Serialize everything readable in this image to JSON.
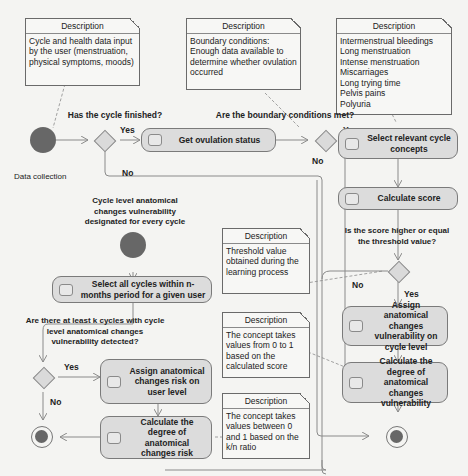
{
  "notes": {
    "data_input": {
      "header": "Description",
      "text": "Cycle and health data input by the user (menstruation, physical symptoms, moods)"
    },
    "boundary": {
      "header": "Description",
      "text": "Boundary conditions: Enough data available to determine whether ovulation occurred"
    },
    "concepts": {
      "header": "Description",
      "items": [
        "Intermenstrual bleedings",
        "Long menstruation",
        "Intense menstruation",
        "Miscarriages",
        "Long trying time",
        "Pelvis pains",
        "Polyuria"
      ]
    },
    "threshold": {
      "header": "Description",
      "text": "Threshold value obtained during the learning process"
    },
    "score_range": {
      "header": "Description",
      "text": "The concept takes values from 0 to 1 based on the calculated score"
    },
    "kn_ratio": {
      "header": "Description",
      "text": "The concept takes values between 0 and 1 based on the k/n ratio"
    }
  },
  "start_nodes": {
    "data_collection": "Data collection",
    "cycle_level": "Cycle level anatomical changes vulnerability designated for every cycle"
  },
  "decisions": {
    "cycle_finished": "Has the cycle finished?",
    "boundary_met": "Are the boundary conditions met?",
    "score_threshold": "Is the score higher or equal the threshold value?",
    "k_cycles": "Are there at least k cycles with cycle level anatomical changes vulnerability detected?"
  },
  "branches": {
    "yes": "Yes",
    "no": "No"
  },
  "activities": {
    "get_ovulation": "Get ovulation status",
    "select_concepts": "Select relevant cycle concepts",
    "calculate_score": "Calculate score",
    "assign_cycle_vuln": "Assign anatomical changes vulnerability on cycle level",
    "calc_degree_vuln": "Calculate the degree of anatomical changes vulnerability",
    "select_cycles": "Select all cycles within n-months period for a given user",
    "assign_user_risk": "Assign anatomical changes risk on user level",
    "calc_degree_risk": "Calculate the degree of anatomical changes risk"
  },
  "colors": {
    "node_fill": "#dcdcdc",
    "dot": "#676767",
    "line": "#8a8a8a",
    "note_bg": "#f7f7f5"
  }
}
